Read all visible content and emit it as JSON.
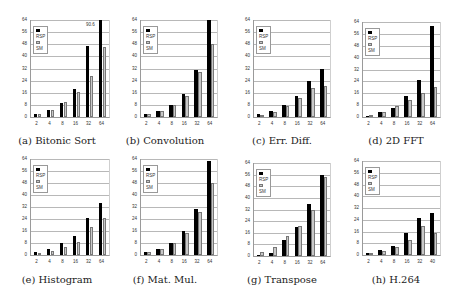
{
  "chart_data": [
    {
      "type": "bar",
      "title": "(a) Bitonic Sort",
      "categories": [
        "2",
        "4",
        "8",
        "16",
        "32",
        "64"
      ],
      "series": [
        {
          "name": "RSP",
          "values": [
            2,
            4.5,
            9.5,
            18.5,
            47,
            90.6
          ]
        },
        {
          "name": "SM",
          "values": [
            2,
            4.5,
            10,
            16.5,
            27,
            46
          ]
        }
      ],
      "annotations": [
        {
          "text": "90.6",
          "x": "64",
          "series": "RSP"
        }
      ],
      "ylim": [
        0,
        64
      ],
      "yticks": [
        0,
        8,
        16,
        24,
        32,
        40,
        48,
        56,
        64
      ],
      "legend": "top-left",
      "grid": true
    },
    {
      "type": "bar",
      "title": "(b) Convolution",
      "categories": [
        "2",
        "4",
        "8",
        "16",
        "32",
        "64"
      ],
      "series": [
        {
          "name": "RSP",
          "values": [
            2,
            4,
            8,
            15,
            31,
            64
          ]
        },
        {
          "name": "SM",
          "values": [
            2,
            4,
            8,
            14,
            30,
            48
          ]
        }
      ],
      "ylim": [
        0,
        64
      ],
      "yticks": [
        0,
        8,
        16,
        24,
        32,
        40,
        48,
        56,
        64
      ],
      "legend": "top-left",
      "grid": true
    },
    {
      "type": "bar",
      "title": "(c) Err. Diff.",
      "categories": [
        "2",
        "4",
        "8",
        "16",
        "32",
        "64"
      ],
      "series": [
        {
          "name": "RSP",
          "values": [
            2,
            4,
            8,
            14,
            24,
            31.5
          ]
        },
        {
          "name": "SM",
          "values": [
            1.5,
            3.5,
            7,
            12.5,
            19,
            20.5
          ]
        }
      ],
      "ylim": [
        0,
        64
      ],
      "yticks": [
        0,
        8,
        16,
        24,
        32,
        40,
        48,
        56,
        64
      ],
      "legend": "top-left",
      "grid": true
    },
    {
      "type": "bar",
      "title": "(d) 2D FFT",
      "categories": [
        "2",
        "4",
        "8",
        "16",
        "32",
        "64"
      ],
      "series": [
        {
          "name": "RSP",
          "values": [
            1,
            3.5,
            6,
            14,
            25,
            61
          ]
        },
        {
          "name": "SM",
          "values": [
            1.5,
            3.5,
            7.5,
            11.5,
            16.5,
            20
          ]
        }
      ],
      "ylim": [
        0,
        64
      ],
      "yticks": [
        0,
        8,
        16,
        24,
        32,
        40,
        48,
        56,
        64
      ],
      "legend": "top-left",
      "grid": true
    },
    {
      "type": "bar",
      "title": "(e) Histogram",
      "categories": [
        "2",
        "4",
        "8",
        "16",
        "32",
        "64"
      ],
      "series": [
        {
          "name": "RSP",
          "values": [
            2,
            4,
            8,
            13,
            25,
            35
          ]
        },
        {
          "name": "SM",
          "values": [
            1.5,
            3,
            5.5,
            9,
            19,
            24.5
          ]
        }
      ],
      "ylim": [
        0,
        64
      ],
      "yticks": [
        0,
        8,
        16,
        24,
        32,
        40,
        48,
        56,
        64
      ],
      "legend": "top-left",
      "grid": true
    },
    {
      "type": "bar",
      "title": "(f) Mat. Mul.",
      "categories": [
        "2",
        "4",
        "8",
        "16",
        "32",
        "64"
      ],
      "series": [
        {
          "name": "RSP",
          "values": [
            2,
            4,
            8,
            16,
            31,
            63
          ]
        },
        {
          "name": "SM",
          "values": [
            2,
            4,
            8,
            15,
            29,
            48
          ]
        }
      ],
      "ylim": [
        0,
        64
      ],
      "yticks": [
        0,
        8,
        16,
        24,
        32,
        40,
        48,
        56,
        64
      ],
      "legend": "top-left",
      "grid": true
    },
    {
      "type": "bar",
      "title": "(g) Transpose",
      "categories": [
        "2",
        "4",
        "8",
        "16",
        "32",
        "64"
      ],
      "series": [
        {
          "name": "RSP",
          "values": [
            1,
            2,
            11,
            20,
            36,
            56
          ]
        },
        {
          "name": "SM",
          "values": [
            2.5,
            6,
            14,
            20.5,
            32,
            54.5
          ]
        }
      ],
      "ylim": [
        0,
        64
      ],
      "yticks": [
        0,
        8,
        16,
        24,
        32,
        40,
        48,
        56,
        64
      ],
      "legend": "top-left",
      "grid": true
    },
    {
      "type": "bar",
      "title": "(h) H.264",
      "categories": [
        "2",
        "4",
        "8",
        "16",
        "32",
        "40"
      ],
      "series": [
        {
          "name": "RSP",
          "values": [
            1.5,
            3.5,
            6,
            15,
            25,
            28.5
          ]
        },
        {
          "name": "SM",
          "values": [
            1.5,
            3,
            5.5,
            10.5,
            20,
            15
          ]
        }
      ],
      "ylim": [
        0,
        64
      ],
      "yticks": [
        0,
        8,
        16,
        24,
        32,
        40,
        48,
        56,
        64
      ],
      "legend": "top-left",
      "grid": true
    }
  ],
  "legend_labels": {
    "rsp": "RSP",
    "sm": "SM"
  }
}
